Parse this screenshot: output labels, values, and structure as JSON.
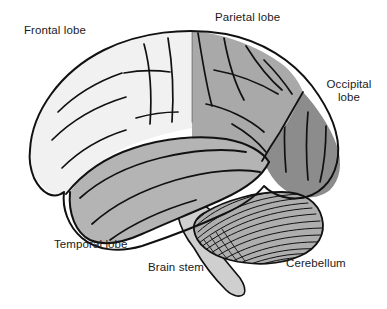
{
  "figure": {
    "type": "anatomical-diagram",
    "background_color": "#ffffff",
    "outline_color": "#000000"
  },
  "labels": {
    "frontal_lobe": "Frontal lobe",
    "parietal_lobe": "Parietal lobe",
    "occipital_lobe_line1": "Occipital",
    "occipital_lobe_line2": "lobe",
    "temporal_lobe": "Temporal lobe",
    "brain_stem": "Brain stem",
    "cerebellum": "Cerebellum"
  },
  "regions": [
    {
      "name": "frontal lobe",
      "label": "Frontal lobe",
      "fill": "#f1f1f1",
      "shading": "very light gray"
    },
    {
      "name": "parietal lobe",
      "label": "Parietal lobe",
      "fill": "#a9a9a9",
      "shading": "medium gray"
    },
    {
      "name": "occipital lobe",
      "label": "Occipital lobe",
      "fill": "#8c8c8c",
      "shading": "dark gray"
    },
    {
      "name": "temporal lobe",
      "label": "Temporal lobe",
      "fill": "#b4b4b4",
      "shading": "medium gray"
    },
    {
      "name": "cerebellum",
      "label": "Cerebellum",
      "fill": "#aeaeae",
      "shading": "medium gray with fine hatching"
    },
    {
      "name": "brain stem",
      "label": "Brain stem",
      "fill": "#cfcfcf",
      "shading": "light gray"
    }
  ]
}
